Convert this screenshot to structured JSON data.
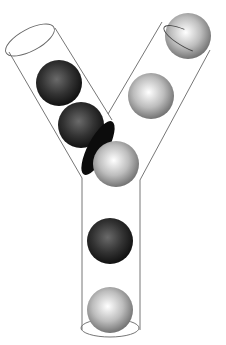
{
  "diagram": {
    "title": "",
    "colors": {
      "tube_outline": "#555555",
      "dark_ball": "#2a2a2a",
      "light_ball": "#d8d8d8",
      "background": "#ffffff"
    },
    "branches": [
      {
        "name": "left-branch",
        "balls": [
          "dark",
          "dark",
          "dark-squeezed"
        ]
      },
      {
        "name": "right-branch",
        "balls": [
          "light",
          "light"
        ]
      },
      {
        "name": "stem",
        "balls": [
          "light",
          "dark",
          "light"
        ]
      }
    ]
  }
}
